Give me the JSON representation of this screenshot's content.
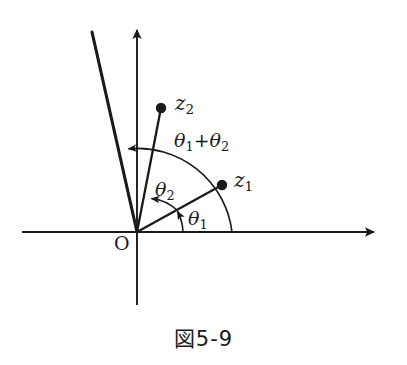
{
  "figure": {
    "caption": "図5-9",
    "background_color": "#ffffff",
    "ink_color": "#1a1a1a"
  },
  "axes": {
    "origin_label": "O",
    "origin_point": {
      "x": 137,
      "y": 232
    },
    "horizontal": {
      "name": "real-axis",
      "x_start": 22,
      "x_end": 378,
      "y": 232,
      "arrow_at": "end"
    },
    "vertical": {
      "name": "imaginary-axis",
      "x": 137,
      "y_start": 305,
      "y_end": 25,
      "arrow_at": "top"
    }
  },
  "points": [
    {
      "id": "z1",
      "label": "z",
      "subscript": "1",
      "x": 222,
      "y": 185,
      "dot_radius": 5
    },
    {
      "id": "z2",
      "label": "z",
      "subscript": "2",
      "x": 161,
      "y": 108,
      "dot_radius": 5
    }
  ],
  "rays": [
    {
      "id": "ray-z1",
      "from_x": 137,
      "from_y": 232,
      "to_x": 222,
      "to_y": 185,
      "width": 2.2
    },
    {
      "id": "ray-z2",
      "from_x": 137,
      "from_y": 232,
      "to_x": 161,
      "to_y": 108,
      "width": 2.2
    },
    {
      "id": "ray-product",
      "from_x": 137,
      "from_y": 232,
      "to_x": 92,
      "to_y": 32,
      "width": 3.0
    }
  ],
  "angle_arcs": [
    {
      "id": "arc-theta1",
      "label": "θ",
      "subscript": "1",
      "label_text": "θ1",
      "radius": 46,
      "start_deg": 0,
      "end_deg": 29,
      "arrow_point": {
        "x": 180,
        "y": 207
      }
    },
    {
      "id": "arc-theta2",
      "label": "θ",
      "subscript": "2",
      "label_text": "θ2",
      "radius": 44,
      "start_deg": 29,
      "end_deg": 77,
      "arrow_point": {
        "x": 148,
        "y": 195
      }
    },
    {
      "id": "arc-theta-sum",
      "label_text": "θ1+θ2",
      "radius": 95,
      "start_deg": 0,
      "end_deg": 103,
      "arrow_point": {
        "x": 124,
        "y": 148
      }
    }
  ],
  "labels": {
    "z1": {
      "base": "z",
      "sub": "1"
    },
    "z2": {
      "base": "z",
      "sub": "2"
    },
    "theta1": {
      "base": "θ",
      "sub": "1"
    },
    "theta2": {
      "base": "θ",
      "sub": "2"
    },
    "theta_sum_first": {
      "base": "θ",
      "sub": "1"
    },
    "theta_sum_plus": "+",
    "theta_sum_second": {
      "base": "θ",
      "sub": "2"
    },
    "origin": "O"
  }
}
